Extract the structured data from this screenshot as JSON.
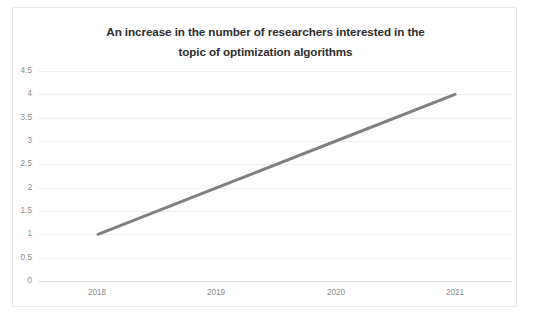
{
  "chart_data": {
    "type": "line",
    "title": "An increase in the number of researchers interested in the topic of optimization algorithms",
    "title_line_1": "An increase in the number of researchers interested in the",
    "title_line_2": "topic of optimization algorithms",
    "xlabel": "",
    "ylabel": "",
    "categories": [
      "2018",
      "2019",
      "2020",
      "2021"
    ],
    "x": [
      2018,
      2019,
      2020,
      2021
    ],
    "values": [
      1,
      2,
      3,
      4
    ],
    "series": [
      {
        "name": "Number of researchers",
        "values": [
          1,
          2,
          3,
          4
        ],
        "color": "#808080"
      }
    ],
    "ylim": [
      0,
      4.5
    ],
    "ytick_labels": [
      "4.5",
      "4",
      "3.5",
      "3",
      "2.5",
      "2",
      "1.5",
      "1",
      "0.5",
      "0"
    ],
    "ytick_values": [
      4.5,
      4,
      3.5,
      3,
      2.5,
      2,
      1.5,
      1,
      0.5,
      0
    ],
    "ytick_step": 0.5,
    "grid": true,
    "grid_axis": "y",
    "legend": false,
    "legend_position": "none",
    "line_color": "#808080",
    "grid_color": "#efefef",
    "tick_label_color": "#8c8c8c",
    "title_color": "#2f2f2f",
    "plot_background": "#ffffff",
    "border_color": "#e9e9e9",
    "markers": false,
    "annotations": []
  }
}
